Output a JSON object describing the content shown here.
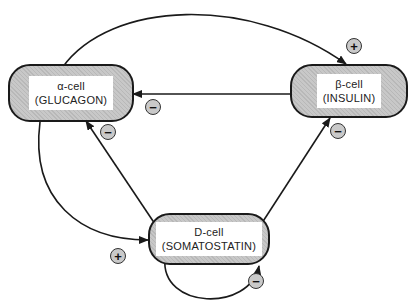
{
  "cells": {
    "alpha": {
      "name": "α-cell",
      "hormone": "(GLUCAGON)"
    },
    "beta": {
      "name": "β-cell",
      "hormone": "(INSULIN)"
    },
    "delta": {
      "name": "D-cell",
      "hormone": "(SOMATOSTATIN)"
    }
  },
  "edges": [
    {
      "from": "α-cell",
      "to": "β-cell",
      "sign": "+"
    },
    {
      "from": "β-cell",
      "to": "α-cell",
      "sign": "−"
    },
    {
      "from": "α-cell",
      "to": "D-cell",
      "sign": "+"
    },
    {
      "from": "D-cell",
      "to": "α-cell",
      "sign": "−"
    },
    {
      "from": "D-cell",
      "to": "β-cell",
      "sign": "−"
    },
    {
      "from": "D-cell",
      "to": "D-cell",
      "sign": "−"
    }
  ],
  "signs": {
    "alpha_to_beta": "+",
    "beta_to_alpha": "−",
    "alpha_to_delta": "+",
    "delta_to_alpha": "−",
    "delta_to_beta": "−",
    "delta_to_delta": "−"
  },
  "colors": {
    "box_fill": "#c8c8c8",
    "line": "#1a1a1a",
    "label_bg": "#ffffff"
  }
}
